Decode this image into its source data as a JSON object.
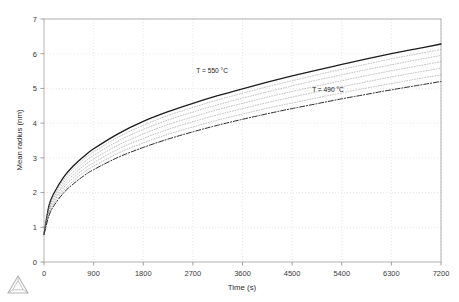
{
  "figure": {
    "background": "#ffffff",
    "frame_color": "#aaaaaa",
    "grid_color": "#d8d8d8",
    "logo_name": "triangular-watermark-logo"
  },
  "chart_data": {
    "type": "line",
    "title": "",
    "xlabel": "Time (s)",
    "ylabel": "Mean radius (nm)",
    "xlim": [
      0,
      7200
    ],
    "ylim": [
      0,
      7
    ],
    "xticks": [
      0,
      900,
      1800,
      2700,
      3600,
      4500,
      5400,
      6300,
      7200
    ],
    "xticklabels": [
      "0",
      "900",
      "1800",
      "2700",
      "3600",
      "4500",
      "5400",
      "6300",
      "7200"
    ],
    "yticks": [
      0,
      1,
      2,
      3,
      4,
      5,
      6,
      7
    ],
    "yticklabels": [
      "0",
      "1",
      "2",
      "3",
      "4",
      "5",
      "6",
      "7"
    ],
    "grid": true,
    "grid_style": "dotted",
    "legend": "inline-annotations",
    "annotations": [
      {
        "text": "T = 550 °C",
        "x": 3050,
        "y": 5.45,
        "name": "curve-label-550"
      },
      {
        "text": "T = 490 °C",
        "x": 5150,
        "y": 4.9,
        "name": "curve-label-490"
      }
    ],
    "x": [
      0,
      90,
      180,
      360,
      540,
      720,
      900,
      1350,
      1800,
      2250,
      2700,
      3150,
      3600,
      4050,
      4500,
      4950,
      5400,
      5850,
      6300,
      6750,
      7200
    ],
    "series": [
      {
        "name": "T = 550 °C",
        "style": "solid",
        "color": "#1c1c1c",
        "width": 1.3,
        "values": [
          0.8,
          1.62,
          1.98,
          2.45,
          2.78,
          3.04,
          3.26,
          3.7,
          4.05,
          4.33,
          4.57,
          4.79,
          4.99,
          5.18,
          5.36,
          5.53,
          5.69,
          5.85,
          6.0,
          6.14,
          6.28
        ]
      },
      {
        "name": "band-curve-1",
        "style": "dotted",
        "color": "#8c8c8c",
        "width": 0.55,
        "values": [
          0.8,
          1.57,
          1.92,
          2.38,
          2.7,
          2.96,
          3.17,
          3.6,
          3.94,
          4.22,
          4.45,
          4.67,
          4.86,
          5.05,
          5.22,
          5.39,
          5.55,
          5.7,
          5.85,
          5.99,
          6.12
        ]
      },
      {
        "name": "band-curve-2",
        "style": "dotted",
        "color": "#8c8c8c",
        "width": 0.55,
        "values": [
          0.8,
          1.52,
          1.86,
          2.3,
          2.61,
          2.87,
          3.07,
          3.49,
          3.82,
          4.09,
          4.32,
          4.53,
          4.72,
          4.9,
          5.07,
          5.24,
          5.39,
          5.54,
          5.68,
          5.82,
          5.95
        ]
      },
      {
        "name": "band-curve-3",
        "style": "dotted",
        "color": "#8c8c8c",
        "width": 0.55,
        "values": [
          0.8,
          1.47,
          1.8,
          2.22,
          2.52,
          2.77,
          2.97,
          3.37,
          3.69,
          3.96,
          4.18,
          4.39,
          4.57,
          4.75,
          4.91,
          5.07,
          5.22,
          5.37,
          5.51,
          5.64,
          5.77
        ]
      },
      {
        "name": "band-curve-4",
        "style": "dotted",
        "color": "#8c8c8c",
        "width": 0.55,
        "values": [
          0.8,
          1.42,
          1.74,
          2.15,
          2.44,
          2.67,
          2.86,
          3.26,
          3.56,
          3.82,
          4.04,
          4.24,
          4.42,
          4.59,
          4.75,
          4.9,
          5.05,
          5.19,
          5.33,
          5.46,
          5.58
        ]
      },
      {
        "name": "band-curve-5",
        "style": "dotted",
        "color": "#8c8c8c",
        "width": 0.55,
        "values": [
          0.8,
          1.38,
          1.68,
          2.07,
          2.35,
          2.58,
          2.76,
          3.14,
          3.43,
          3.68,
          3.89,
          4.09,
          4.26,
          4.43,
          4.58,
          4.73,
          4.87,
          5.01,
          5.14,
          5.27,
          5.39
        ]
      },
      {
        "name": "T = 490 °C",
        "style": "dashdot",
        "color": "#2a2a2a",
        "width": 1.0,
        "values": [
          0.8,
          1.33,
          1.62,
          2.0,
          2.26,
          2.48,
          2.66,
          3.02,
          3.3,
          3.54,
          3.75,
          3.94,
          4.11,
          4.27,
          4.42,
          4.56,
          4.7,
          4.83,
          4.96,
          5.08,
          5.2
        ]
      }
    ]
  }
}
